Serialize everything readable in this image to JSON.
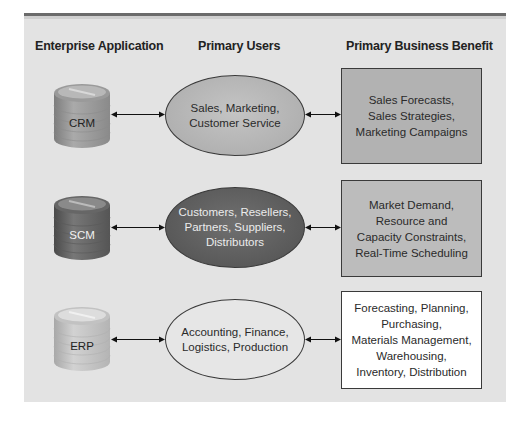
{
  "headers": {
    "enterprise_application": "Enterprise Application",
    "primary_users": "Primary Users",
    "primary_business_benefit": "Primary Business Benefit"
  },
  "rows": [
    {
      "application": "CRM",
      "users": "Sales, Marketing,\nCustomer Service",
      "benefit": "Sales Forecasts,\nSales Strategies,\nMarketing Campaigns"
    },
    {
      "application": "SCM",
      "users": "Customers, Resellers,\nPartners, Suppliers,\nDistributors",
      "benefit": "Market Demand,\nResource and\nCapacity Constraints,\nReal-Time Scheduling"
    },
    {
      "application": "ERP",
      "users": "Accounting, Finance,\nLogistics, Production",
      "benefit": "Forecasting, Planning,\nPurchasing,\nMaterials Management,\nWarehousing,\nInventory, Distribution"
    }
  ],
  "colors": {
    "panel_background": "#e3e3e3",
    "top_rule": "#6b6b6b",
    "crm_shade": "#a9a9a9",
    "scm_shade": "#505050",
    "erp_shade": "#e6e6e6"
  }
}
